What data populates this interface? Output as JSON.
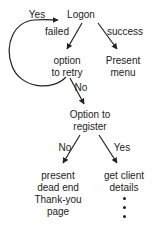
{
  "diagram": {
    "type": "flowchart",
    "nodes": {
      "logon": {
        "label": "Logon"
      },
      "retry": {
        "lines": [
          "option",
          "to retry"
        ]
      },
      "present_menu": {
        "lines": [
          "Present",
          "menu"
        ]
      },
      "register": {
        "lines": [
          "Option to",
          "register"
        ]
      },
      "dead_end": {
        "lines": [
          "present",
          "dead end",
          "Thank-you",
          "page"
        ]
      },
      "client": {
        "lines": [
          "get client",
          "details"
        ],
        "continuation": "⋮"
      }
    },
    "edges": {
      "logon_failed": {
        "from": "logon",
        "to": "retry",
        "label": "failed"
      },
      "logon_success": {
        "from": "logon",
        "to": "present_menu",
        "label": "success"
      },
      "retry_yes": {
        "from": "retry",
        "to": "logon",
        "label": "Yes"
      },
      "retry_no": {
        "from": "retry",
        "to": "register",
        "label": "No"
      },
      "register_no": {
        "from": "register",
        "to": "dead_end",
        "label": "No"
      },
      "register_yes": {
        "from": "register",
        "to": "client",
        "label": "Yes"
      }
    },
    "colors": {
      "stroke": "#222222",
      "background": "#ffffff"
    }
  }
}
